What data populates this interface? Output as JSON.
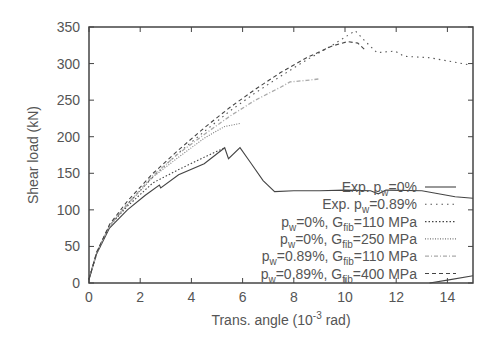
{
  "chart_data": {
    "type": "line",
    "title": "",
    "xlabel": "Trans. angle (10^-3 rad)",
    "xlabel_parts": {
      "pre": "Trans. angle (10",
      "sup": "-3",
      "post": " rad)"
    },
    "ylabel": "Shear load (kN)",
    "xlim": [
      0,
      15
    ],
    "ylim": [
      0,
      350
    ],
    "xticks": [
      0,
      2,
      4,
      6,
      8,
      10,
      12,
      14
    ],
    "yticks": [
      0,
      50,
      100,
      150,
      200,
      250,
      300,
      350
    ],
    "grid": false,
    "legend_position": "bottom-right",
    "series": [
      {
        "name": "Exp. p_w=0%",
        "legend": {
          "p1": "Exp. p",
          "s1": "w",
          "p2": "=0%"
        },
        "style": "solid",
        "color": "#444444",
        "x": [
          0,
          0.3,
          0.8,
          1.5,
          2.2,
          2.75,
          2.8,
          3.5,
          4.5,
          5.3,
          5.45,
          5.9,
          6.3,
          6.8,
          7.25,
          8,
          9,
          10,
          11,
          11.3,
          11.6,
          13,
          14.3,
          15
        ],
        "y": [
          5,
          40,
          75,
          100,
          120,
          134,
          130,
          148,
          163,
          185,
          170,
          185,
          165,
          140,
          125,
          126,
          126,
          127,
          126,
          122,
          127,
          126,
          118,
          116
        ]
      },
      {
        "name": "Exp. p_w=0.89%",
        "legend": {
          "p1": "Exp. p",
          "s1": "w",
          "p2": "=0.89%"
        },
        "style": "dotted-sparse",
        "color": "#555555",
        "x": [
          0,
          0.3,
          0.8,
          1.5,
          2.5,
          3.5,
          4.5,
          5.5,
          6.5,
          7.5,
          8.5,
          9.5,
          10.0,
          10.4,
          10.8,
          11.25,
          11.95,
          12.3,
          13.3,
          14.9
        ],
        "y": [
          5,
          40,
          78,
          108,
          145,
          178,
          207,
          235,
          260,
          283,
          305,
          325,
          336,
          345,
          330,
          315,
          317,
          310,
          308,
          298
        ]
      },
      {
        "name": "p_w=0%, G_fib=110 MPa",
        "legend": {
          "p1": "p",
          "s1": "w",
          "p2": "=0%, G",
          "s2": "fib",
          "p3": "=110 MPa"
        },
        "style": "dotted",
        "color": "#444444",
        "x": [
          0,
          0.3,
          0.8,
          1.5,
          2.5,
          3.5,
          4.5,
          5.0,
          5.3
        ],
        "y": [
          5,
          42,
          78,
          105,
          137,
          155,
          172,
          180,
          185
        ]
      },
      {
        "name": "p_w=0%, G_fib=250 MPa",
        "legend": {
          "p1": "p",
          "s1": "w",
          "p2": "=0%, G",
          "s2": "fib",
          "p3": "=250 MPa"
        },
        "style": "dotted-fine",
        "color": "#777777",
        "x": [
          0,
          0.3,
          0.8,
          1.5,
          2.5,
          3.5,
          4.5,
          5.3,
          5.9
        ],
        "y": [
          5,
          42,
          78,
          107,
          145,
          172,
          198,
          214,
          218
        ]
      },
      {
        "name": "p_w=0.89%, G_fib=110 MPa",
        "legend": {
          "p1": "p",
          "s1": "w",
          "p2": "=0.89%, G",
          "s2": "fib",
          "p3": "=110 MPa"
        },
        "style": "dash-dot-light",
        "color": "#aaaaaa",
        "x": [
          0,
          0.3,
          0.8,
          1.5,
          2.5,
          3.5,
          4.5,
          5.5,
          6.5,
          7.5,
          7.85,
          8.5,
          9.0
        ],
        "y": [
          5,
          42,
          78,
          108,
          147,
          177,
          203,
          228,
          250,
          268,
          275,
          277,
          279
        ]
      },
      {
        "name": "p_w=0.89%, G_fib=400 MPa",
        "legend": {
          "p1": "p",
          "s1": "w",
          "p2": "=0.89%, G",
          "s2": "fib",
          "p3": "=400 MPa"
        },
        "style": "dashed",
        "color": "#444444",
        "x": [
          0,
          0.3,
          0.8,
          1.5,
          2.5,
          3.5,
          4.5,
          5.5,
          6.5,
          7.5,
          8.5,
          9.5,
          10.1,
          10.5,
          10.8
        ],
        "y": [
          5,
          42,
          80,
          112,
          150,
          182,
          212,
          240,
          265,
          288,
          308,
          324,
          330,
          328,
          318
        ]
      },
      {
        "name": "unlabeled (bottom right)",
        "style": "solid",
        "color": "#444444",
        "in_legend": false,
        "x": [
          13.3,
          14,
          15
        ],
        "y": [
          0,
          4,
          10
        ]
      }
    ]
  }
}
